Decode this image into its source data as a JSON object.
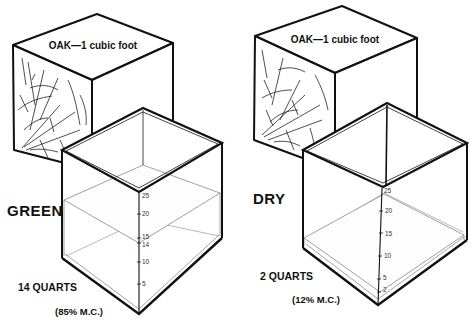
{
  "figure": {
    "colors": {
      "ink": "#111111",
      "thin_line": "#777777",
      "background": "#ffffff"
    }
  },
  "panels": [
    {
      "id": "green",
      "cube_label": "OAK—1 cubic foot",
      "state_label": "GREEN",
      "water_quarts_label": "14 QUARTS",
      "moisture_label": "(85% M.C.)",
      "water_quarts": 14,
      "moisture_content_percent": 85,
      "scale_ticks": [
        "25",
        "20",
        "15",
        "14",
        "10",
        "5"
      ],
      "water_level_tick": "14"
    },
    {
      "id": "dry",
      "cube_label": "OAK—1 cubic foot",
      "state_label": "DRY",
      "water_quarts_label": "2 QUARTS",
      "moisture_label": "(12% M.C.)",
      "water_quarts": 2,
      "moisture_content_percent": 12,
      "scale_ticks": [
        "25",
        "20",
        "15",
        "10",
        "5",
        "2"
      ],
      "water_level_tick": "2"
    }
  ]
}
